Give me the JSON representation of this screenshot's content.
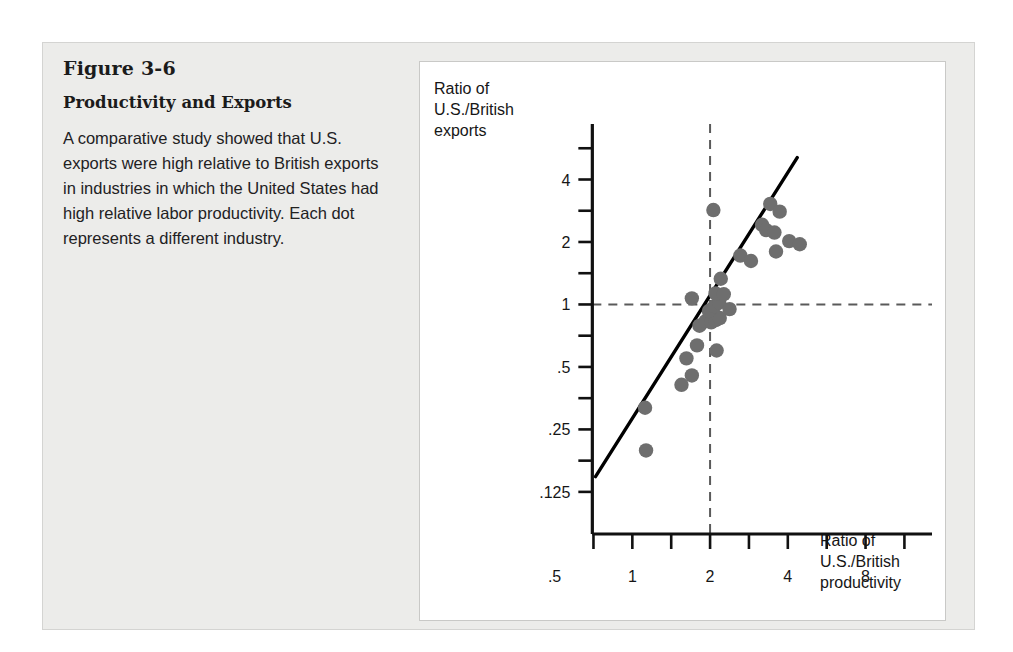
{
  "figure": {
    "number": "Figure 3-6",
    "title": "Productivity and Exports",
    "description": "A comparative study showed that U.S. exports were high relative to British exports in industries in which the United States had high relative labor productivity. Each dot represents a different industry."
  },
  "colors": {
    "panel_background": "#ececea",
    "chart_background": "#ffffff",
    "dot": "#6e6e6e",
    "axis": "#111111",
    "reference_line": "#5a5a5a",
    "fit_line": "#000000",
    "text": "#1b1b1b"
  },
  "chart_data": {
    "type": "scatter",
    "title": "Productivity and Exports",
    "xlabel": "Ratio of U.S./British productivity",
    "ylabel": "Ratio of U.S./British exports",
    "xlabel_lines": [
      "Ratio of",
      "U.S./British",
      "productivity"
    ],
    "ylabel_lines": [
      "Ratio of",
      "U.S./British",
      "exports"
    ],
    "xscale": "log",
    "yscale": "log",
    "grid": false,
    "legend": false,
    "xticks": [
      0.5,
      1,
      2,
      4,
      8
    ],
    "xtick_labels": [
      ".5",
      "1",
      "2",
      "4",
      "8"
    ],
    "yticks": [
      0.125,
      0.25,
      0.5,
      1,
      2,
      4
    ],
    "ytick_labels": [
      ".125",
      ".25",
      ".5",
      "1",
      "2",
      "4"
    ],
    "xlim": [
      0.33,
      13
    ],
    "ylim": [
      0.1,
      6.2
    ],
    "minor_ticks": true,
    "reference_lines": [
      {
        "orientation": "vertical",
        "value": 2,
        "style": "dashed"
      },
      {
        "orientation": "horizontal",
        "value": 1,
        "style": "dashed"
      }
    ],
    "fit_line": {
      "style": "solid",
      "x_start": 0.72,
      "y_start": 0.148,
      "x_end": 4.35,
      "y_end": 5.1
    },
    "points": [
      {
        "x": 1.13,
        "y": 0.198
      },
      {
        "x": 1.12,
        "y": 0.318
      },
      {
        "x": 1.55,
        "y": 0.41
      },
      {
        "x": 1.7,
        "y": 0.455
      },
      {
        "x": 1.62,
        "y": 0.55
      },
      {
        "x": 1.78,
        "y": 0.635
      },
      {
        "x": 2.12,
        "y": 0.6
      },
      {
        "x": 1.82,
        "y": 0.79
      },
      {
        "x": 1.92,
        "y": 0.83
      },
      {
        "x": 2.02,
        "y": 0.82
      },
      {
        "x": 2.1,
        "y": 0.84
      },
      {
        "x": 2.18,
        "y": 0.86
      },
      {
        "x": 1.98,
        "y": 0.93
      },
      {
        "x": 2.08,
        "y": 0.98
      },
      {
        "x": 2.17,
        "y": 1.02
      },
      {
        "x": 2.38,
        "y": 0.95
      },
      {
        "x": 1.7,
        "y": 1.07
      },
      {
        "x": 2.1,
        "y": 1.13
      },
      {
        "x": 2.26,
        "y": 1.12
      },
      {
        "x": 2.2,
        "y": 1.33
      },
      {
        "x": 2.06,
        "y": 2.85
      },
      {
        "x": 2.62,
        "y": 1.72
      },
      {
        "x": 2.88,
        "y": 1.62
      },
      {
        "x": 3.18,
        "y": 2.42
      },
      {
        "x": 3.42,
        "y": 3.05
      },
      {
        "x": 3.3,
        "y": 2.28
      },
      {
        "x": 3.55,
        "y": 2.22
      },
      {
        "x": 3.72,
        "y": 2.8
      },
      {
        "x": 3.6,
        "y": 1.8
      },
      {
        "x": 4.05,
        "y": 2.02
      },
      {
        "x": 4.45,
        "y": 1.95
      }
    ]
  }
}
